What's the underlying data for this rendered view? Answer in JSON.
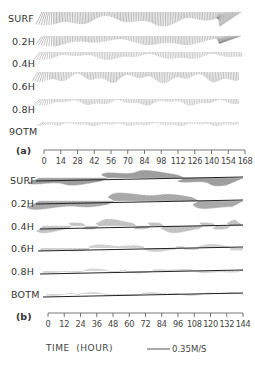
{
  "chart_data": [
    {
      "type": "stick_plot",
      "panel": "(a)",
      "title": "",
      "xlabel": "TIME (HOUR)",
      "ylabel": "",
      "rows": [
        "SURF",
        "0.2H",
        "0.4H",
        "0.6H",
        "0.8H",
        "BOTM"
      ],
      "row_labels_rendered": [
        "SURF",
        "0.2H",
        "0.4H",
        "0.6H",
        "0.8H",
        "9OTM"
      ],
      "x_ticks": [
        0,
        14,
        28,
        42,
        56,
        70,
        84,
        98,
        112,
        126,
        140,
        154,
        168
      ],
      "x_tick_labels": [
        "0",
        "14",
        "28",
        "42",
        "56",
        "70",
        "84",
        "98",
        "112",
        "126",
        "140",
        "154",
        "168"
      ],
      "xlim": [
        0,
        168
      ],
      "grid": false,
      "description": "Current velocity vectors (stick plot) at six depths; dense near-vertical sticks with a strong event near hour 140-168 at upper layers"
    },
    {
      "type": "stick_plot",
      "panel": "(b)",
      "title": "",
      "xlabel": "TIME (HOUR)",
      "ylabel": "",
      "rows": [
        "SURF",
        "0.2H",
        "0.4H",
        "0.6H",
        "0.8H",
        "BOTM"
      ],
      "x_ticks": [
        0,
        12,
        24,
        36,
        48,
        60,
        72,
        84,
        96,
        108,
        120,
        132,
        144
      ],
      "x_tick_labels": [
        "0",
        "12",
        "24",
        "36",
        "48",
        "60",
        "72",
        "84",
        "96",
        "108",
        "120",
        "132",
        "144"
      ],
      "xlim": [
        0,
        144
      ],
      "grid": false,
      "description": "Current velocity vectors (stick plot) at six depths; strongly inclined sticks near surface, weak near-horizontal sticks near bottom"
    }
  ],
  "scale": {
    "label": "0.35M/S"
  },
  "panel_a": {
    "tag": "(a)",
    "rows": [
      "SURF",
      "0.2H",
      "0.4H",
      "0.6H",
      "0.8H",
      "9OTM"
    ],
    "ticks": [
      "0",
      "14",
      "28",
      "42",
      "56",
      "70",
      "84",
      "98",
      "112",
      "126",
      "140",
      "154",
      "168"
    ]
  },
  "panel_b": {
    "tag": "(b)",
    "rows": [
      "SURF",
      "0.2H",
      "0.4H",
      "0.6H",
      "0.8H",
      "BOTM"
    ],
    "ticks": [
      "0",
      "12",
      "24",
      "36",
      "48",
      "60",
      "72",
      "84",
      "96",
      "108",
      "120",
      "132",
      "144"
    ]
  },
  "footer": {
    "xlabel": "TIME  (HOUR)",
    "scale_label": "0.35M/S"
  }
}
